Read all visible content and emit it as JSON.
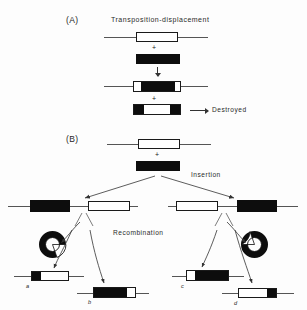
{
  "figure": {
    "width": 307,
    "height": 310,
    "background": "#fdfdfd",
    "ink": "#0d0d0d",
    "line_color": "#555555"
  },
  "panels": [
    {
      "id": "A",
      "letter": "(A)",
      "title": "Transposition-displacement"
    },
    {
      "id": "B",
      "letter": "(B)",
      "title": ""
    }
  ],
  "annotations": {
    "destroyed": "Destroyed",
    "insertion": "Insertion",
    "recombination": "Recombination",
    "plus_a1": "+",
    "plus_a2": "+",
    "plus_b1": "+",
    "plus_left": "+",
    "plus_right": "+"
  },
  "product_labels": {
    "a": "a",
    "b": "b",
    "c": "c",
    "d": "d"
  },
  "panel_a_elements": [
    {
      "name": "target-chromosome",
      "description": "horizontal DNA line with open (white) transposon box"
    },
    {
      "name": "donor-element",
      "description": "solid black transposon block"
    },
    {
      "name": "recombinant-chromosome",
      "description": "DNA line with white-black-white composite box"
    },
    {
      "name": "destroyed-product",
      "description": "black-white-black composite box, destroyed"
    }
  ],
  "panel_b_elements": [
    {
      "name": "target-chromosome-b",
      "description": "horizontal DNA line with open (white) transposon box"
    },
    {
      "name": "donor-element-b",
      "description": "solid black transposon block"
    },
    {
      "name": "left-recombinant",
      "description": "DNA line: black box left, white box right"
    },
    {
      "name": "right-recombinant",
      "description": "DNA line: white box left, black box right"
    },
    {
      "name": "left-circle",
      "description": "black circular plasmid with white notch"
    },
    {
      "name": "right-circle",
      "description": "black circular plasmid with white notch"
    },
    {
      "name": "product-a",
      "description": "line with small black block then white box"
    },
    {
      "name": "product-b",
      "description": "line with black box then small white block"
    },
    {
      "name": "product-c",
      "description": "line with small white block then black box"
    },
    {
      "name": "product-d",
      "description": "line with white box then small black block"
    }
  ]
}
